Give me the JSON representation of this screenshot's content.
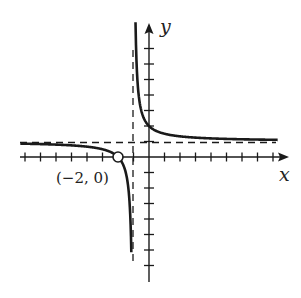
{
  "chart_data": {
    "type": "line",
    "title": "",
    "xlabel": "x",
    "ylabel": "y",
    "function": "y = (x + 2)/(x + 1)",
    "xlim": [
      -8.3,
      8.6
    ],
    "ylim": [
      -8.6,
      8.6
    ],
    "grid": false,
    "tick_spacing": 1,
    "x_ticks": [
      -8,
      -7,
      -6,
      -5,
      -4,
      -3,
      -2,
      -1,
      1,
      2,
      3,
      4,
      5,
      6,
      7,
      8
    ],
    "y_ticks": [
      -7,
      -6,
      -5,
      -4,
      -3,
      -2,
      -1,
      1,
      2,
      3,
      4,
      5,
      6,
      7
    ],
    "asymptotes": {
      "vertical": -1,
      "horizontal": 1
    },
    "y_intercept": 2,
    "annotations": [
      {
        "point": [
          -2,
          0
        ],
        "label": "(−2, 0)",
        "marker": "open-circle"
      }
    ],
    "series": [
      {
        "name": "left-branch",
        "x": [
          -8.3,
          -6,
          -4,
          -3,
          -2.5,
          -2,
          -1.5,
          -1.3,
          -1.2,
          -1.14
        ],
        "y": [
          0.86,
          0.8,
          0.67,
          0.5,
          0.33,
          0.0,
          -1.0,
          -2.33,
          -4.0,
          -6.1
        ]
      },
      {
        "name": "right-branch",
        "x": [
          -0.86,
          -0.8,
          -0.7,
          -0.5,
          0,
          1,
          2,
          4,
          8.3
        ],
        "y": [
          8.1,
          6.0,
          4.33,
          3.0,
          2.0,
          1.5,
          1.33,
          1.2,
          1.11
        ]
      }
    ]
  },
  "labels": {
    "x_axis": "x",
    "y_axis": "y",
    "point": "(−2, 0)"
  },
  "colors": {
    "ink": "#1a1a1a",
    "background": "#ffffff"
  }
}
